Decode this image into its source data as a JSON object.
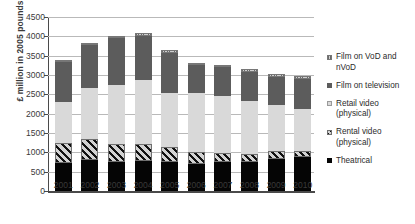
{
  "chart_data": {
    "type": "bar",
    "stacked": true,
    "title": "",
    "xlabel": "",
    "ylabel": "£ million in 2005 pounds",
    "ylim": [
      0,
      4500
    ],
    "ytick_step": 500,
    "yticks": [
      "0",
      "500",
      "1000",
      "1500",
      "2000",
      "2500",
      "3000",
      "3500",
      "4000",
      "4500"
    ],
    "categories": [
      "2001",
      "2002",
      "2003",
      "2004",
      "2005",
      "2006",
      "2007",
      "2008",
      "2009",
      "2010"
    ],
    "grid": true,
    "legend_position": "right",
    "series": [
      {
        "name": "Theatrical",
        "color": "#050505",
        "values": [
          730,
          810,
          760,
          775,
          750,
          700,
          740,
          740,
          840,
          880
        ]
      },
      {
        "name": "Rental video (physical)",
        "color": "#d2d2d2",
        "pattern": "diagonal-hatch",
        "values": [
          520,
          530,
          460,
          435,
          395,
          300,
          250,
          215,
          190,
          160
        ]
      },
      {
        "name": "Retail video (physical)",
        "color": "#d9d9d9",
        "values": [
          1040,
          1320,
          1520,
          1660,
          1400,
          1530,
          1460,
          1375,
          1185,
          1085
        ]
      },
      {
        "name": "Film on television",
        "color": "#5c5c5c",
        "values": [
          1050,
          1105,
          1215,
          1145,
          1030,
          720,
          750,
          755,
          730,
          780
        ]
      },
      {
        "name": "Film on VoD and nVoD",
        "color": "#cfcfcf",
        "pattern": "vertical-hatch",
        "values": [
          40,
          50,
          55,
          60,
          60,
          60,
          60,
          65,
          70,
          75
        ]
      }
    ],
    "totals": [
      3380,
      3815,
      4010,
      4075,
      3635,
      3310,
      3260,
      3150,
      3015,
      2980
    ]
  },
  "legend": {
    "items": [
      {
        "label": "Film on VoD and nVoD",
        "swatch": "vod-swatch-icon"
      },
      {
        "label": "Film on television",
        "swatch": "tv-swatch-icon"
      },
      {
        "label": "Retail video (physical)",
        "swatch": "retail-swatch-icon"
      },
      {
        "label": "Rental video (physical)",
        "swatch": "rental-swatch-icon"
      },
      {
        "label": "Theatrical",
        "swatch": "theatrical-swatch-icon"
      }
    ]
  }
}
